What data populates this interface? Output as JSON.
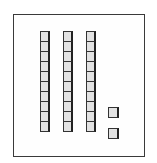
{
  "figure": {
    "tens_rods": 3,
    "cubes_per_rod": 10,
    "unit_cubes": 2,
    "represented_value": 32,
    "colors": {
      "block_fill": "#e2e2e2",
      "block_outline": "#333333",
      "frame": "#3a3a3a"
    }
  }
}
